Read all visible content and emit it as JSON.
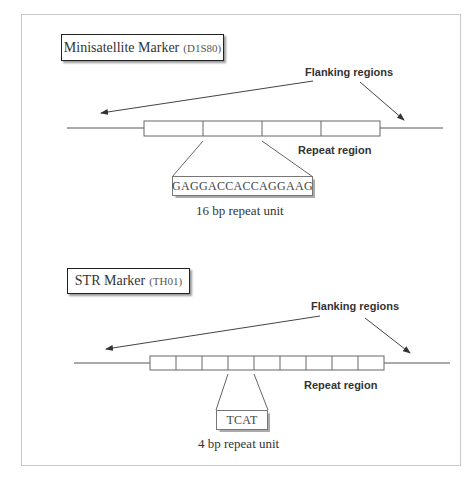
{
  "minisatellite": {
    "title": "Minisatellite Marker",
    "marker_id": "(D1S80)",
    "flanking_label": "Flanking regions",
    "repeat_label": "Repeat region",
    "sequence": "GAGGACCACCAGGAAG",
    "unit_label": "16 bp repeat unit",
    "repeat_cells": 4
  },
  "str": {
    "title": "STR Marker",
    "marker_id": "(TH01)",
    "flanking_label": "Flanking regions",
    "repeat_label": "Repeat region",
    "sequence": "TCAT",
    "unit_label": "4 bp repeat unit",
    "repeat_cells": 9
  },
  "colors": {
    "line": "#555555",
    "frame": "#c8c8c8",
    "text": "#333333"
  }
}
